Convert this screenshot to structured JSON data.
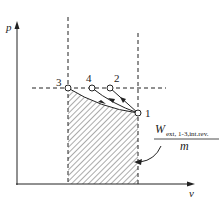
{
  "diagram": {
    "type": "p-v diagram",
    "axes": {
      "y_label": "p",
      "x_label": "v"
    },
    "points": [
      {
        "id": "1",
        "label": "1"
      },
      {
        "id": "2",
        "label": "2"
      },
      {
        "id": "3",
        "label": "3"
      },
      {
        "id": "4",
        "label": "4"
      }
    ],
    "annotation": {
      "numerator_main": "W",
      "numerator_sub": "ext, 1-3,int.rev.",
      "denominator": "m"
    },
    "colors": {
      "line": "#222222",
      "hatch": "#444444",
      "background": "#ffffff"
    }
  }
}
